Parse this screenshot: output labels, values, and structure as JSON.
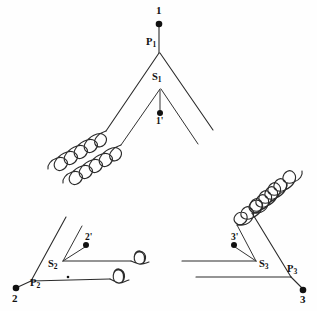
{
  "figure": {
    "type": "schematic-diagram",
    "background_color": "#fefefe",
    "line_color": "#2b2b2b",
    "node_color": "#111111"
  },
  "terminals": {
    "primary_line": [
      {
        "id": "t1",
        "label": "1",
        "x": 159,
        "y": 24
      },
      {
        "id": "t2",
        "label": "2",
        "x": 16,
        "y": 288
      },
      {
        "id": "t3",
        "label": "3",
        "x": 303,
        "y": 290
      }
    ],
    "secondary_line": [
      {
        "id": "t1p",
        "label": "1'",
        "x": 160,
        "y": 113
      },
      {
        "id": "t2p",
        "label": "2'",
        "x": 86,
        "y": 245
      },
      {
        "id": "t3p",
        "label": "3'",
        "x": 234,
        "y": 245
      }
    ]
  },
  "primary_nodes": [
    {
      "id": "P1",
      "label": "P",
      "subscript": "1",
      "x": 159,
      "y": 52,
      "label_x": 146,
      "label_y": 38
    },
    {
      "id": "P2",
      "label": "P",
      "subscript": "2",
      "x": 30,
      "y": 283,
      "label_x": 30,
      "label_y": 281
    },
    {
      "id": "P3",
      "label": "P",
      "subscript": "3",
      "x": 292,
      "y": 279,
      "label_x": 288,
      "label_y": 266
    }
  ],
  "secondary_nodes": [
    {
      "id": "S1",
      "label": "S",
      "subscript": "1",
      "x": 160,
      "y": 88,
      "label_x": 152,
      "label_y": 74
    },
    {
      "id": "S2",
      "label": "S",
      "subscript": "2",
      "x": 62,
      "y": 262,
      "label_x": 52,
      "label_y": 262
    },
    {
      "id": "S3",
      "label": "S",
      "subscript": "3",
      "x": 256,
      "y": 262,
      "label_x": 260,
      "label_y": 262
    }
  ],
  "windings": [
    {
      "id": "w-left-primary",
      "name": "primary-winding-left",
      "side": "left",
      "circuit": "primary",
      "loops": 5
    },
    {
      "id": "w-left-secondary",
      "name": "secondary-winding-left",
      "side": "left",
      "circuit": "secondary",
      "loops": 5
    },
    {
      "id": "w-right-primary",
      "name": "primary-winding-right",
      "side": "right",
      "circuit": "primary",
      "loops": 5
    },
    {
      "id": "w-right-secondary",
      "name": "secondary-winding-right",
      "side": "right",
      "circuit": "secondary",
      "loops": 5
    },
    {
      "id": "w-bottom-primary",
      "name": "primary-winding-bottom",
      "side": "bottom",
      "circuit": "primary",
      "loops": 6
    },
    {
      "id": "w-bottom-secondary",
      "name": "secondary-winding-bottom",
      "side": "bottom",
      "circuit": "secondary",
      "loops": 4
    }
  ],
  "labels": {
    "terminal_1": "1",
    "terminal_2": "2",
    "terminal_3": "3",
    "terminal_1_prime": "1'",
    "terminal_2_prime": "2'",
    "terminal_3_prime": "3'",
    "p1_base": "P",
    "p1_sub": "1",
    "p2_base": "P",
    "p2_sub": "2",
    "p3_base": "P",
    "p3_sub": "3",
    "s1_base": "S",
    "s1_sub": "1",
    "s2_base": "S",
    "s2_sub": "2",
    "s3_base": "S",
    "s3_sub": "3"
  }
}
